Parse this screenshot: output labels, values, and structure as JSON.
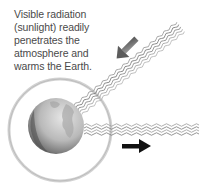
{
  "diagram": {
    "caption_lines": [
      "Visible radiation",
      "(sunlight) readily",
      "penetrates the",
      "atmosphere and",
      "warms the Earth."
    ],
    "elements": {
      "incoming_arrow": "arrow-down-left-icon",
      "outgoing_arrow": "arrow-right-icon",
      "globe": "earth-globe",
      "atmosphere": "atmosphere-halo-ring",
      "incoming_radiation": "wavy-sunlight-beam",
      "outgoing_radiation": "wavy-infrared-lines"
    },
    "colors": {
      "text": "#4a4a4a",
      "halo": "#c8c8c8",
      "globe_light": "#cfcfcf",
      "globe_dark": "#5a5a5a",
      "wave": "#8a8a8a",
      "incoming_arrow": "#6e6e6e",
      "outgoing_arrow": "#111111"
    }
  }
}
